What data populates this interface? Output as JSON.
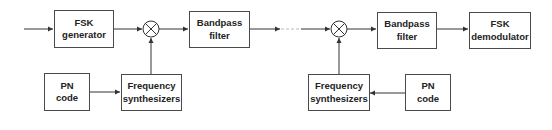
{
  "diagram": {
    "transmitter": {
      "blocks": {
        "fsk_generator": "FSK\ngenerator",
        "bandpass_filter": "Bandpass\nfilter",
        "pn_code": "PN\ncode",
        "frequency_synthesizers": "Frequency\nsynthesizers"
      },
      "mixer_symbol": "⊗"
    },
    "receiver": {
      "blocks": {
        "bandpass_filter": "Bandpass\nfilter",
        "fsk_demodulator": "FSK\ndemodulator",
        "frequency_synthesizers": "Frequency\nsynthesizers",
        "pn_code": "PN\ncode"
      },
      "mixer_symbol": "⊗"
    },
    "colors": {
      "line": "#333333",
      "border": "#4a4a4a",
      "text": "#222222"
    }
  }
}
